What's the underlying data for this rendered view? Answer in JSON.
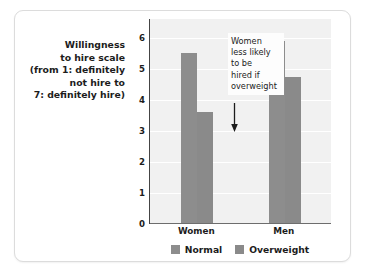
{
  "card": {
    "border_color": "#dcdcdc",
    "background": "#ffffff"
  },
  "y_axis_caption": {
    "lines": [
      "Willingness",
      "to hire scale",
      "(from 1: definitely",
      "not hire to",
      "7: definitely hire)"
    ]
  },
  "annotation": {
    "lines": [
      "Women",
      "less likely",
      "to be",
      "hired if",
      "overweight"
    ],
    "arrow": "down-arrow",
    "points_at": "Women Overweight bar"
  },
  "chart_data": {
    "type": "bar",
    "title": "",
    "xlabel": "",
    "ylabel": "Willingness to hire scale (from 1: definitely not hire to 7: definitely hire)",
    "categories": [
      "Women",
      "Men"
    ],
    "series": [
      {
        "name": "Normal",
        "values": [
          5.5,
          5.9
        ],
        "color": "#8d8d8d"
      },
      {
        "name": "Overweight",
        "values": [
          3.6,
          4.75
        ],
        "color": "#8a8a8a"
      }
    ],
    "ylim": [
      0,
      6.6
    ],
    "yticks": [
      0,
      1,
      2,
      3,
      4,
      5,
      6
    ],
    "ytick_labels": [
      "0",
      "1",
      "2",
      "3",
      "4",
      "5",
      "6"
    ],
    "grid": true,
    "grid_color": "#ffffff",
    "plot_background": "#f1f1f1",
    "legend_position": "bottom",
    "legend_entries": [
      "Normal",
      "Overweight"
    ],
    "annotations": [
      {
        "text": "Women less likely to be hired if overweight",
        "target_category": "Women",
        "target_series": "Overweight"
      }
    ]
  }
}
